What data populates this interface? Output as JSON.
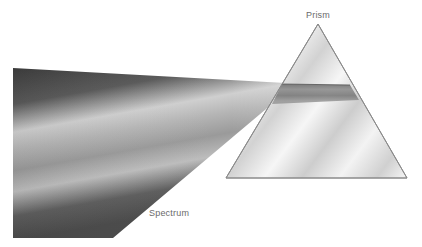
{
  "diagram": {
    "labels": {
      "prism": "Prism",
      "spectrum": "Spectrum"
    },
    "elements": [
      {
        "id": "prism",
        "shape": "triangle",
        "apex": [
          318,
          24
        ],
        "base_left": [
          226,
          178
        ],
        "base_right": [
          407,
          178
        ]
      },
      {
        "id": "spectrum-beam",
        "shape": "quadrilateral",
        "corners": [
          [
            13,
            68
          ],
          [
            285,
            83
          ],
          [
            270,
            108
          ],
          [
            113,
            238
          ],
          [
            13,
            238
          ]
        ]
      },
      {
        "id": "light-beam-in-prism",
        "shape": "band",
        "from_x": 275,
        "to_x": 358,
        "top_y": 83,
        "bottom_y": 100
      }
    ],
    "colors": {
      "background": "#ffffff",
      "prism_outline": "#8a8a8a",
      "spectrum_dark": "#3a3a3a",
      "spectrum_light": "#d8d8d8",
      "label_text": "#6a6a6a"
    }
  }
}
